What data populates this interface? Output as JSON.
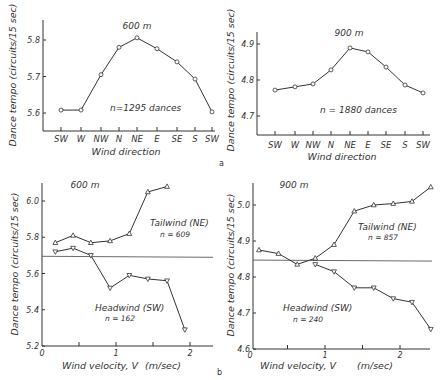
{
  "figure": {
    "panel_a_label": "a",
    "panel_b_label": "b"
  },
  "chart_data": [
    {
      "id": "a-600",
      "type": "line",
      "panel": "a",
      "title": "600 m",
      "xlabel": "Wind direction",
      "ylabel": "Dance tempo (circuits/15 sec)",
      "categories": [
        "SW",
        "W",
        "NW",
        "N",
        "NE",
        "E",
        "SE",
        "S",
        "SW"
      ],
      "values": [
        5.608,
        5.608,
        5.705,
        5.78,
        5.806,
        5.776,
        5.74,
        5.693,
        5.603
      ],
      "yticks": [
        5.6,
        5.7,
        5.8
      ],
      "ytick_labels": [
        "5.6",
        "5.7",
        "5.8"
      ],
      "ylim": [
        5.55,
        5.85
      ],
      "annotation": "n=1295 dances",
      "marker": "circle",
      "grid": false
    },
    {
      "id": "a-900",
      "type": "line",
      "panel": "a",
      "title": "900 m",
      "xlabel": "Wind direction",
      "ylabel": "Dance tempo (circuits/15 sec)",
      "categories": [
        "SW",
        "W",
        "NW",
        "N",
        "NE",
        "E",
        "SE",
        "S",
        "SW"
      ],
      "values": [
        4.772,
        4.781,
        4.789,
        4.828,
        4.889,
        4.878,
        4.836,
        4.786,
        4.764
      ],
      "yticks": [
        4.7,
        4.8,
        4.9
      ],
      "ytick_labels": [
        "4.7",
        "4.8",
        "4.9"
      ],
      "ylim": [
        4.65,
        4.95
      ],
      "annotation": "n = 1880 dances",
      "marker": "circle",
      "grid": false
    },
    {
      "id": "b-600",
      "type": "line",
      "panel": "b",
      "title": "600 m",
      "xlabel": "Wind velocity, V",
      "xunit": "(m/sec)",
      "ylabel": "Dance tempo (circuits/15 sec)",
      "xticks": [
        0,
        0.5,
        1,
        1.5,
        2
      ],
      "xtick_labels": [
        "0",
        "",
        "1",
        "",
        "2"
      ],
      "yticks": [
        5.2,
        5.4,
        5.6,
        5.8,
        6.0
      ],
      "ytick_labels": [
        "5.2",
        "5.4",
        "5.6",
        "5.8",
        "6.0"
      ],
      "xlim": [
        0,
        2.3
      ],
      "ylim": [
        5.2,
        6.15
      ],
      "reference_line_y": 5.695,
      "series": [
        {
          "name": "Tailwind (NE)",
          "n_label": "n = 609",
          "marker": "triangle-up",
          "x": [
            0.18,
            0.42,
            0.66,
            0.92,
            1.18,
            1.43,
            1.69
          ],
          "values": [
            5.77,
            5.81,
            5.77,
            5.78,
            5.82,
            6.05,
            6.08
          ]
        },
        {
          "name": "Headwind (SW)",
          "n_label": "n = 162",
          "marker": "triangle-down",
          "x": [
            0.18,
            0.42,
            0.66,
            0.92,
            1.18,
            1.43,
            1.69,
            1.93
          ],
          "values": [
            5.72,
            5.74,
            5.7,
            5.52,
            5.59,
            5.57,
            5.56,
            5.29
          ]
        }
      ],
      "grid": false
    },
    {
      "id": "b-900",
      "type": "line",
      "panel": "b",
      "title": "900 m",
      "xlabel": "Wind velocity, V",
      "xunit": "(m/sec)",
      "ylabel": "Dance tempo (circuits/15 sec)",
      "xticks": [
        0,
        0.5,
        1,
        1.5,
        2
      ],
      "xtick_labels": [
        "0",
        "",
        "1",
        "",
        "2"
      ],
      "yticks": [
        4.6,
        4.7,
        4.8,
        4.9,
        5.0
      ],
      "ytick_labels": [
        "4.6",
        "4.7",
        "4.8",
        "4.9",
        "5.0"
      ],
      "xlim": [
        0,
        2.45
      ],
      "ylim": [
        4.6,
        5.06
      ],
      "reference_line_y": 4.847,
      "series": [
        {
          "name": "Tailwind (NE)",
          "n_label": "n = 857",
          "marker": "triangle-up",
          "x": [
            0.12,
            0.38,
            0.63,
            0.87,
            1.12,
            1.39,
            1.65,
            1.91,
            2.16,
            2.41
          ],
          "values": [
            4.875,
            4.865,
            4.835,
            4.852,
            4.89,
            4.983,
            5.0,
            5.004,
            5.01,
            5.05
          ]
        },
        {
          "name": "Headwind (SW)",
          "n_label": "n = 240",
          "marker": "triangle-down",
          "x": [
            0.87,
            1.12,
            1.39,
            1.65,
            1.91,
            2.16,
            2.41
          ],
          "values": [
            4.835,
            4.815,
            4.77,
            4.77,
            4.74,
            4.73,
            4.655
          ]
        }
      ],
      "grid": false
    }
  ]
}
